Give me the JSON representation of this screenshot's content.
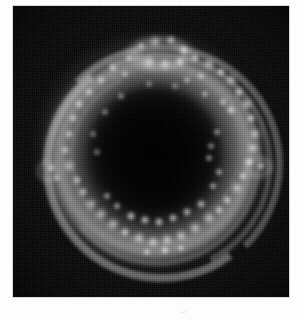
{
  "figure": {
    "panel_label": "grayscale-astronomical-image",
    "caption_partial": "shell-like structure with bright filaments",
    "background_color": "#ffffff",
    "panel_background_color": "#050505",
    "feature_color": "#ffffff"
  },
  "chart_data": {
    "type": "heatmap",
    "title": "",
    "subtitle": "",
    "xlabel": "",
    "ylabel": "",
    "colormap": "grayscale",
    "panel": {
      "x": 13,
      "y": 6,
      "width": 276,
      "height": 291
    },
    "axis_ranges": {
      "x": [
        0,
        276
      ],
      "y": [
        0,
        291
      ]
    },
    "grid": false,
    "legend": null,
    "tick_labels": {
      "x": [],
      "y": []
    },
    "annotations": [],
    "structures": [
      {
        "name": "main-shell-ring",
        "shape": "annulus",
        "center": [
          141,
          151
        ],
        "outer_radius": 113,
        "inner_radius": 82,
        "peak_intensity": 0.62
      },
      {
        "name": "inner-shell",
        "shape": "annulus",
        "center": [
          142,
          147
        ],
        "outer_radius": 86,
        "inner_radius": 66,
        "peak_intensity": 0.3
      },
      {
        "name": "dark-interior",
        "shape": "ellipse",
        "center": [
          141,
          149
        ],
        "radius": 71,
        "peak_intensity": 0.04
      },
      {
        "name": "top-loop",
        "shape": "ellipse",
        "center": [
          147,
          48
        ],
        "radius": 37,
        "peak_intensity": 0.5
      },
      {
        "name": "left-knob",
        "shape": "ellipse",
        "center": [
          35,
          165
        ],
        "radius": 13,
        "peak_intensity": 0.42
      },
      {
        "name": "right-spur",
        "shape": "ellipse",
        "center": [
          245,
          161
        ],
        "radius": 17,
        "peak_intensity": 0.46
      }
    ],
    "filaments": [
      {
        "left": 26,
        "top": 38,
        "width": 230,
        "height": 226,
        "border_width": 7,
        "rotate": 0,
        "color": "rgba(208,208,208,0.40)",
        "arc": "top"
      },
      {
        "left": 34,
        "top": 46,
        "width": 214,
        "height": 210,
        "border_width": 6,
        "rotate": 18,
        "color": "rgba(196,196,196,0.34)",
        "arc": "right"
      },
      {
        "left": 30,
        "top": 44,
        "width": 220,
        "height": 216,
        "border_width": 8,
        "rotate": 188,
        "color": "rgba(224,224,224,0.46)",
        "arc": "bottom"
      },
      {
        "left": 40,
        "top": 52,
        "width": 200,
        "height": 196,
        "border_width": 5,
        "rotate": 96,
        "color": "rgba(170,170,170,0.30)",
        "arc": "left"
      },
      {
        "left": 56,
        "top": 64,
        "width": 170,
        "height": 166,
        "border_width": 5,
        "rotate": 200,
        "color": "rgba(150,150,150,0.26)",
        "arc": "inner-bottom"
      },
      {
        "left": 62,
        "top": 58,
        "width": 160,
        "height": 158,
        "border_width": 4,
        "rotate": 10,
        "color": "rgba(140,140,140,0.22)",
        "arc": "inner-top"
      }
    ],
    "knots": [
      {
        "x": 142,
        "y": 36,
        "r": 7,
        "i": 0.72
      },
      {
        "x": 158,
        "y": 34,
        "r": 6,
        "i": 0.66
      },
      {
        "x": 128,
        "y": 40,
        "r": 5,
        "i": 0.58
      },
      {
        "x": 171,
        "y": 44,
        "r": 6,
        "i": 0.7
      },
      {
        "x": 116,
        "y": 52,
        "r": 5,
        "i": 0.6
      },
      {
        "x": 136,
        "y": 56,
        "r": 8,
        "i": 0.88
      },
      {
        "x": 152,
        "y": 58,
        "r": 7,
        "i": 0.82
      },
      {
        "x": 167,
        "y": 56,
        "r": 6,
        "i": 0.74
      },
      {
        "x": 182,
        "y": 52,
        "r": 6,
        "i": 0.7
      },
      {
        "x": 196,
        "y": 58,
        "r": 7,
        "i": 0.78
      },
      {
        "x": 100,
        "y": 62,
        "r": 6,
        "i": 0.62
      },
      {
        "x": 112,
        "y": 68,
        "r": 5,
        "i": 0.56
      },
      {
        "x": 88,
        "y": 74,
        "r": 6,
        "i": 0.6
      },
      {
        "x": 208,
        "y": 66,
        "r": 6,
        "i": 0.72
      },
      {
        "x": 218,
        "y": 74,
        "r": 7,
        "i": 0.76
      },
      {
        "x": 188,
        "y": 70,
        "r": 5,
        "i": 0.62
      },
      {
        "x": 174,
        "y": 74,
        "r": 5,
        "i": 0.58
      },
      {
        "x": 76,
        "y": 86,
        "r": 6,
        "i": 0.62
      },
      {
        "x": 66,
        "y": 98,
        "r": 6,
        "i": 0.66
      },
      {
        "x": 60,
        "y": 112,
        "r": 6,
        "i": 0.62
      },
      {
        "x": 226,
        "y": 86,
        "r": 6,
        "i": 0.74
      },
      {
        "x": 234,
        "y": 98,
        "r": 7,
        "i": 0.8
      },
      {
        "x": 238,
        "y": 112,
        "r": 6,
        "i": 0.72
      },
      {
        "x": 218,
        "y": 104,
        "r": 6,
        "i": 0.7
      },
      {
        "x": 210,
        "y": 96,
        "r": 5,
        "i": 0.62
      },
      {
        "x": 56,
        "y": 128,
        "r": 6,
        "i": 0.6
      },
      {
        "x": 52,
        "y": 144,
        "r": 6,
        "i": 0.62
      },
      {
        "x": 56,
        "y": 160,
        "r": 7,
        "i": 0.68
      },
      {
        "x": 64,
        "y": 174,
        "r": 6,
        "i": 0.64
      },
      {
        "x": 38,
        "y": 162,
        "r": 6,
        "i": 0.58
      },
      {
        "x": 44,
        "y": 172,
        "r": 5,
        "i": 0.54
      },
      {
        "x": 242,
        "y": 128,
        "r": 7,
        "i": 0.8
      },
      {
        "x": 240,
        "y": 142,
        "r": 7,
        "i": 0.84
      },
      {
        "x": 236,
        "y": 156,
        "r": 6,
        "i": 0.76
      },
      {
        "x": 248,
        "y": 160,
        "r": 6,
        "i": 0.68
      },
      {
        "x": 230,
        "y": 170,
        "r": 6,
        "i": 0.72
      },
      {
        "x": 224,
        "y": 182,
        "r": 7,
        "i": 0.78
      },
      {
        "x": 214,
        "y": 194,
        "r": 6,
        "i": 0.72
      },
      {
        "x": 70,
        "y": 186,
        "r": 6,
        "i": 0.66
      },
      {
        "x": 78,
        "y": 198,
        "r": 7,
        "i": 0.72
      },
      {
        "x": 88,
        "y": 208,
        "r": 7,
        "i": 0.76
      },
      {
        "x": 100,
        "y": 218,
        "r": 7,
        "i": 0.8
      },
      {
        "x": 112,
        "y": 226,
        "r": 6,
        "i": 0.76
      },
      {
        "x": 126,
        "y": 232,
        "r": 7,
        "i": 0.82
      },
      {
        "x": 140,
        "y": 236,
        "r": 7,
        "i": 0.84
      },
      {
        "x": 154,
        "y": 234,
        "r": 7,
        "i": 0.86
      },
      {
        "x": 168,
        "y": 230,
        "r": 7,
        "i": 0.82
      },
      {
        "x": 182,
        "y": 222,
        "r": 7,
        "i": 0.8
      },
      {
        "x": 196,
        "y": 212,
        "r": 7,
        "i": 0.78
      },
      {
        "x": 206,
        "y": 204,
        "r": 6,
        "i": 0.74
      },
      {
        "x": 118,
        "y": 210,
        "r": 6,
        "i": 0.78
      },
      {
        "x": 132,
        "y": 214,
        "r": 6,
        "i": 0.76
      },
      {
        "x": 146,
        "y": 216,
        "r": 6,
        "i": 0.74
      },
      {
        "x": 160,
        "y": 212,
        "r": 6,
        "i": 0.72
      },
      {
        "x": 174,
        "y": 206,
        "r": 6,
        "i": 0.7
      },
      {
        "x": 188,
        "y": 198,
        "r": 6,
        "i": 0.7
      },
      {
        "x": 104,
        "y": 200,
        "r": 5,
        "i": 0.66
      },
      {
        "x": 94,
        "y": 190,
        "r": 5,
        "i": 0.62
      },
      {
        "x": 152,
        "y": 244,
        "r": 6,
        "i": 0.74
      },
      {
        "x": 134,
        "y": 246,
        "r": 5,
        "i": 0.66
      },
      {
        "x": 168,
        "y": 242,
        "r": 5,
        "i": 0.68
      },
      {
        "x": 200,
        "y": 180,
        "r": 5,
        "i": 0.66
      },
      {
        "x": 206,
        "y": 166,
        "r": 5,
        "i": 0.64
      },
      {
        "x": 196,
        "y": 152,
        "r": 5,
        "i": 0.58
      },
      {
        "x": 84,
        "y": 146,
        "r": 5,
        "i": 0.46
      },
      {
        "x": 80,
        "y": 128,
        "r": 5,
        "i": 0.46
      },
      {
        "x": 92,
        "y": 106,
        "r": 5,
        "i": 0.5
      },
      {
        "x": 108,
        "y": 90,
        "r": 5,
        "i": 0.52
      },
      {
        "x": 192,
        "y": 88,
        "r": 5,
        "i": 0.56
      },
      {
        "x": 204,
        "y": 126,
        "r": 5,
        "i": 0.56
      },
      {
        "x": 198,
        "y": 140,
        "r": 5,
        "i": 0.54
      },
      {
        "x": 136,
        "y": 78,
        "r": 5,
        "i": 0.46
      },
      {
        "x": 162,
        "y": 80,
        "r": 5,
        "i": 0.44
      }
    ]
  }
}
